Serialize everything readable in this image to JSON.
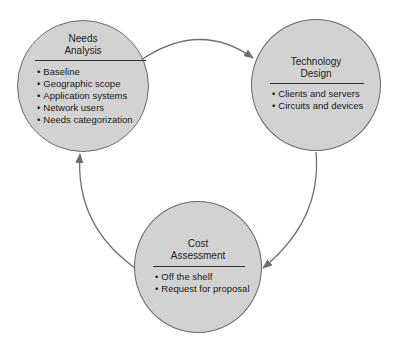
{
  "diagram": {
    "nodes": [
      {
        "id": "needs-analysis",
        "title_line1": "Needs",
        "title_line2": "Analysis",
        "items": [
          "Baseline",
          "Geographic scope",
          "Application systems",
          "Network users",
          "Needs categorization"
        ]
      },
      {
        "id": "technology-design",
        "title_line1": "Technology",
        "title_line2": "Design",
        "items": [
          "Clients and servers",
          "Circuits and devices"
        ]
      },
      {
        "id": "cost-assessment",
        "title_line1": "Cost",
        "title_line2": "Assessment",
        "items": [
          "Off the shelf",
          "Request for proposal"
        ]
      }
    ],
    "edges": [
      {
        "from": "needs-analysis",
        "to": "technology-design"
      },
      {
        "from": "technology-design",
        "to": "cost-assessment"
      },
      {
        "from": "cost-assessment",
        "to": "needs-analysis"
      }
    ],
    "colors": {
      "node_fill": "#d2d2d2",
      "node_stroke": "#6a6a6a",
      "arrow": "#707070"
    }
  }
}
